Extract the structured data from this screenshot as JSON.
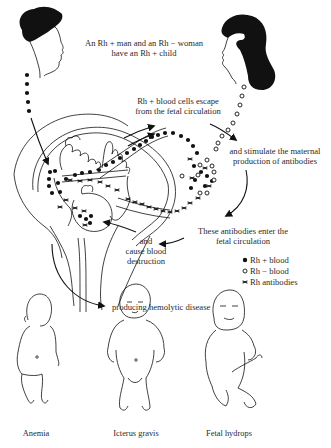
{
  "diagram": {
    "title_text": {
      "line1": "An Rh + man and an Rh − woman",
      "line2": "have an Rh + child"
    },
    "steps": {
      "escape": {
        "line1": "Rh + blood cells escape",
        "line2": "from the fetal circulation"
      },
      "stimulate": {
        "line1": "and stimulate the maternal",
        "line2": "production of antibodies"
      },
      "enter": {
        "line1": "These antibodies enter the",
        "line2": "fetal circulation"
      },
      "destroy": {
        "line1": "and",
        "line2": "cause blood",
        "line3": "destruction"
      },
      "disease": "producing hemolytic disease"
    },
    "legend": [
      {
        "symbol": "filled-circle",
        "label": "Rh + blood"
      },
      {
        "symbol": "open-circle",
        "label": "Rh − blood"
      },
      {
        "symbol": "antibody-cross",
        "label": "Rh antibodies"
      }
    ],
    "outcomes": [
      {
        "label": "Anemia"
      },
      {
        "label": "Icterus gravis"
      },
      {
        "label": "Fetal hydrops"
      }
    ],
    "colors": {
      "ink": "#111111",
      "text": "#2a2a2a",
      "background": "#ffffff"
    }
  }
}
